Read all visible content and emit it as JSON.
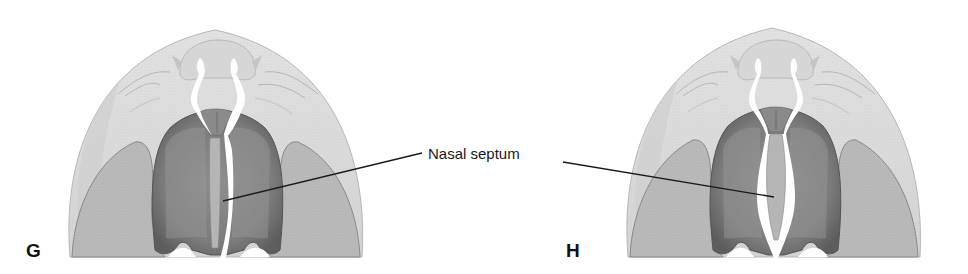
{
  "figure": {
    "panels": [
      {
        "letter": "G",
        "septum_state": "attached-left"
      },
      {
        "letter": "H",
        "septum_state": "midline-separated"
      }
    ],
    "callout": {
      "label": "Nasal septum"
    },
    "colors": {
      "outer_dome": "#dcdcdc",
      "outer_dome_edge": "#b8b8b8",
      "palatal_shelf": "#b9b9b9",
      "palatal_shelf_edge": "#8a8a8a",
      "nasal_cavity_dark": "#7a7a7a",
      "nasal_cavity_mid": "#a0a0a0",
      "septum": "#b5b5b5",
      "white_gap": "#ffffff",
      "leader_line": "#1a1a1a"
    }
  }
}
